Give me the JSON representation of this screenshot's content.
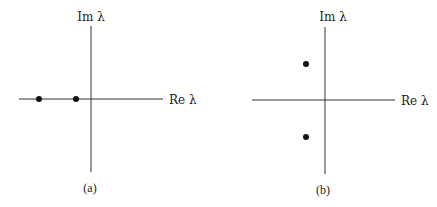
{
  "panels": [
    {
      "id": "a",
      "caption": "(a)",
      "y_axis_label": "Im λ",
      "x_axis_label": "Re λ",
      "origin": [
        91,
        99
      ],
      "x_axis": [
        19,
        163
      ],
      "y_axis": [
        26,
        172
      ],
      "points": [
        {
          "x": 39,
          "y": 99
        },
        {
          "x": 76,
          "y": 99
        }
      ],
      "description": "Two real negative eigenvalues on the real axis"
    },
    {
      "id": "b",
      "caption": "(b)",
      "y_axis_label": "Im λ",
      "x_axis_label": "Re λ",
      "origin": [
        325,
        100
      ],
      "x_axis": [
        252,
        395
      ],
      "y_axis": [
        27,
        174
      ],
      "points": [
        {
          "x": 306,
          "y": 64
        },
        {
          "x": 306,
          "y": 137
        }
      ],
      "description": "Complex conjugate pair of eigenvalues with negative real part"
    }
  ],
  "colors": {
    "axis": "#333333",
    "point": "#111111",
    "background": "#ffffff"
  }
}
